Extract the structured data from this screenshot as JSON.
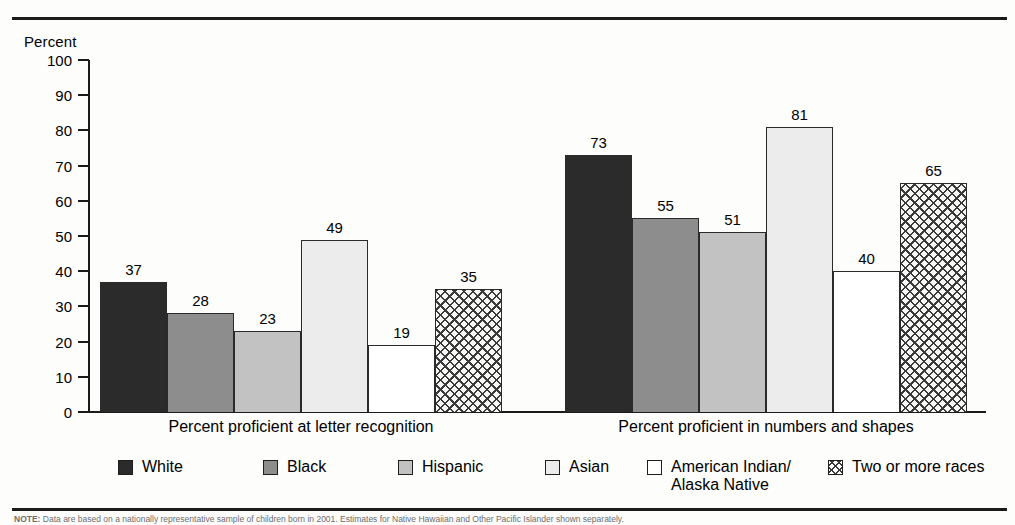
{
  "axis": {
    "y_title": "Percent",
    "ticks": [
      0,
      10,
      20,
      30,
      40,
      50,
      60,
      70,
      80,
      90,
      100
    ]
  },
  "legend": {
    "items": [
      {
        "label": "White",
        "swatch": "solid-black",
        "color": "#2b2b2b"
      },
      {
        "label": "Black",
        "swatch": "solid-dark-gray",
        "color": "#8d8d8d"
      },
      {
        "label": "Hispanic",
        "swatch": "solid-light-gray",
        "color": "#c2c2c2"
      },
      {
        "label": "Asian",
        "swatch": "solid-pale-gray",
        "color": "#ececec"
      },
      {
        "label": "American Indian/",
        "label2": "Alaska Native",
        "swatch": "outline-white",
        "color": "#ffffff"
      },
      {
        "label": "Two or more races",
        "swatch": "crosshatch",
        "color": "#f7f7f6"
      }
    ]
  },
  "note": {
    "prefix": "NOTE:",
    "text": "Data are based on a nationally representative sample of children born in 2001. Estimates for Native Hawaiian and Other Pacific Islander shown separately."
  },
  "chart_data": {
    "type": "bar",
    "title": "",
    "xlabel": "",
    "ylabel": "Percent",
    "ylim": [
      0,
      100
    ],
    "ytick_step": 10,
    "grid": false,
    "legend_position": "bottom",
    "categories": [
      "Percent proficient at letter recognition",
      "Percent proficient in numbers and shapes"
    ],
    "series": [
      {
        "name": "White",
        "values": [
          37,
          73
        ]
      },
      {
        "name": "Black",
        "values": [
          28,
          55
        ]
      },
      {
        "name": "Hispanic",
        "values": [
          23,
          51
        ]
      },
      {
        "name": "Asian",
        "values": [
          49,
          81
        ]
      },
      {
        "name": "American Indian/Alaska Native",
        "values": [
          19,
          40
        ]
      },
      {
        "name": "Two or more races",
        "values": [
          35,
          65
        ]
      }
    ]
  }
}
